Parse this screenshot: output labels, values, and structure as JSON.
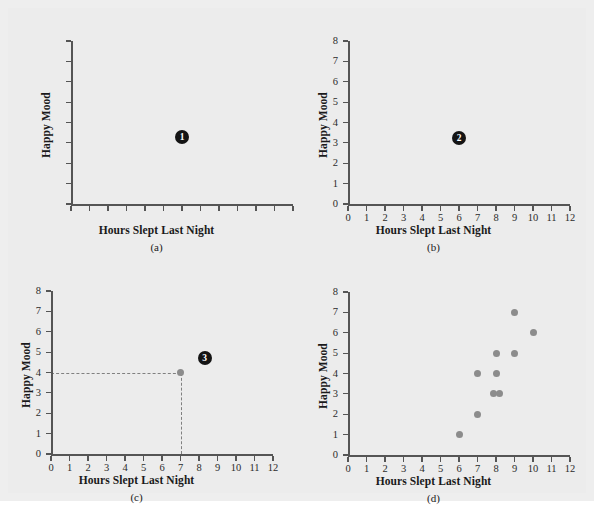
{
  "figure": {
    "background_color": "#ececec",
    "panels": [
      {
        "id": "a",
        "caption": "(a)",
        "xlabel": "Hours Slept Last Night",
        "ylabel": "Happy Mood",
        "show_tick_labels": false,
        "marker_label": "1"
      },
      {
        "id": "b",
        "caption": "(b)",
        "xlabel": "Hours Slept Last Night",
        "ylabel": "Happy Mood",
        "show_tick_labels": true,
        "marker_label": "2"
      },
      {
        "id": "c",
        "caption": "(c)",
        "xlabel": "Hours Slept Last Night",
        "ylabel": "Happy Mood",
        "show_tick_labels": true,
        "marker_label": "3"
      },
      {
        "id": "d",
        "caption": "(d)",
        "xlabel": "Hours Slept Last Night",
        "ylabel": "Happy Mood",
        "show_tick_labels": true,
        "marker_label": ""
      }
    ]
  },
  "chart_data": [
    {
      "panel": "a",
      "type": "scatter",
      "title": "",
      "xlabel": "Hours Slept Last Night",
      "ylabel": "Happy Mood",
      "xlim": [
        0,
        12
      ],
      "ylim": [
        0,
        8
      ],
      "xticks": [
        0,
        1,
        2,
        3,
        4,
        5,
        6,
        7,
        8,
        9,
        10,
        11,
        12
      ],
      "yticks": [
        0,
        1,
        2,
        3,
        4,
        5,
        6,
        7,
        8
      ],
      "xtick_labels": [
        "",
        "",
        "",
        "",
        "",
        "",
        "",
        "",
        "",
        "",
        "",
        "",
        ""
      ],
      "ytick_labels": [
        "",
        "",
        "",
        "",
        "",
        "",
        "",
        "",
        ""
      ],
      "grid": false,
      "legend": "none",
      "annotations": [
        {
          "text": "1",
          "style": "filled-circle-number",
          "x": 6.0,
          "y": 3.3
        }
      ],
      "points": []
    },
    {
      "panel": "b",
      "type": "scatter",
      "title": "",
      "xlabel": "Hours Slept Last Night",
      "ylabel": "Happy Mood",
      "xlim": [
        0,
        12
      ],
      "ylim": [
        0,
        8
      ],
      "xticks": [
        0,
        1,
        2,
        3,
        4,
        5,
        6,
        7,
        8,
        9,
        10,
        11,
        12
      ],
      "yticks": [
        0,
        1,
        2,
        3,
        4,
        5,
        6,
        7,
        8
      ],
      "xtick_labels": [
        "0",
        "1",
        "2",
        "3",
        "4",
        "5",
        "6",
        "7",
        "8",
        "9",
        "10",
        "11",
        "12"
      ],
      "ytick_labels": [
        "0",
        "1",
        "2",
        "3",
        "4",
        "5",
        "6",
        "7",
        "8"
      ],
      "grid": false,
      "legend": "none",
      "annotations": [
        {
          "text": "2",
          "style": "filled-circle-number",
          "x": 6.0,
          "y": 3.25
        }
      ],
      "points": []
    },
    {
      "panel": "c",
      "type": "scatter",
      "title": "",
      "xlabel": "Hours Slept Last Night",
      "ylabel": "Happy Mood",
      "xlim": [
        0,
        12
      ],
      "ylim": [
        0,
        8
      ],
      "xticks": [
        0,
        1,
        2,
        3,
        4,
        5,
        6,
        7,
        8,
        9,
        10,
        11,
        12
      ],
      "yticks": [
        0,
        1,
        2,
        3,
        4,
        5,
        6,
        7,
        8
      ],
      "xtick_labels": [
        "0",
        "1",
        "2",
        "3",
        "4",
        "5",
        "6",
        "7",
        "8",
        "9",
        "10",
        "11",
        "12"
      ],
      "ytick_labels": [
        "0",
        "1",
        "2",
        "3",
        "4",
        "5",
        "6",
        "7",
        "8"
      ],
      "grid": false,
      "legend": "none",
      "points": [
        {
          "x": 7,
          "y": 4
        }
      ],
      "guide_lines": [
        {
          "orientation": "horizontal",
          "from_x": 0,
          "to_x": 7,
          "y": 4,
          "style": "dashed"
        },
        {
          "orientation": "vertical",
          "from_y": 0,
          "to_y": 4,
          "x": 7,
          "style": "dashed"
        }
      ],
      "annotations": [
        {
          "text": "3",
          "style": "filled-circle-number",
          "x": 8.3,
          "y": 4.7
        }
      ]
    },
    {
      "panel": "d",
      "type": "scatter",
      "title": "",
      "xlabel": "Hours Slept Last Night",
      "ylabel": "Happy Mood",
      "xlim": [
        0,
        12
      ],
      "ylim": [
        0,
        8
      ],
      "xticks": [
        0,
        1,
        2,
        3,
        4,
        5,
        6,
        7,
        8,
        9,
        10,
        11,
        12
      ],
      "yticks": [
        0,
        1,
        2,
        3,
        4,
        5,
        6,
        7,
        8
      ],
      "xtick_labels": [
        "0",
        "1",
        "2",
        "3",
        "4",
        "5",
        "6",
        "7",
        "8",
        "9",
        "10",
        "11",
        "12"
      ],
      "ytick_labels": [
        "0",
        "1",
        "2",
        "3",
        "4",
        "5",
        "6",
        "7",
        "8"
      ],
      "grid": false,
      "legend": "none",
      "points": [
        {
          "x": 6,
          "y": 1
        },
        {
          "x": 7,
          "y": 2
        },
        {
          "x": 7.85,
          "y": 3
        },
        {
          "x": 8.2,
          "y": 3
        },
        {
          "x": 7,
          "y": 4
        },
        {
          "x": 8,
          "y": 4
        },
        {
          "x": 8,
          "y": 5
        },
        {
          "x": 9,
          "y": 5
        },
        {
          "x": 9,
          "y": 7
        },
        {
          "x": 10,
          "y": 6
        }
      ],
      "annotations": []
    }
  ]
}
